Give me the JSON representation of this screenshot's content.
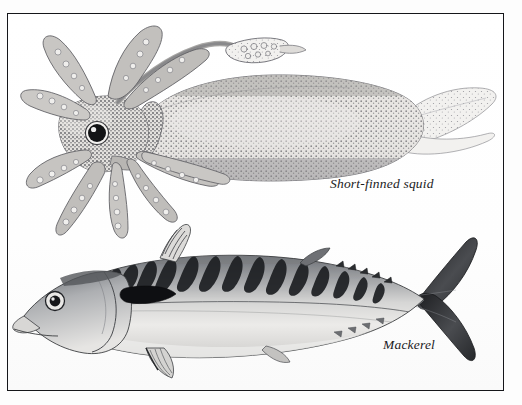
{
  "plate": {
    "title": "Short-finned squid and Mackerel illustration plate",
    "background_color": "#ffffff",
    "frame_color": "#15161a",
    "medium": "black-and-white stipple pen illustration"
  },
  "specimens": [
    {
      "id": "short-finned-squid",
      "label": "Short-finned squid",
      "position": "upper",
      "orientation": "head-left, tail-right",
      "features": [
        "mantle",
        "caudal fin",
        "eye",
        "arms",
        "tentacular club",
        "suckers"
      ],
      "ink_color": "#6d6f72"
    },
    {
      "id": "mackerel",
      "label": "Mackerel",
      "position": "lower",
      "orientation": "head-left, tail-right",
      "features": [
        "dorsal bars",
        "first dorsal fin",
        "second dorsal fin",
        "pectoral fin",
        "pelvic fin",
        "finlets",
        "forked caudal fin",
        "eye"
      ],
      "ink_color": "#2b2d30"
    }
  ],
  "captions": {
    "squid": "Short-finned squid",
    "mackerel": "Mackerel"
  }
}
